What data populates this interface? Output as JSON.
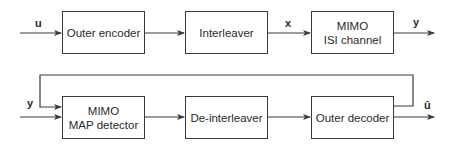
{
  "diagram": {
    "type": "block-diagram",
    "top_row": {
      "blocks": [
        {
          "id": "outer-encoder",
          "lines": [
            "Outer encoder"
          ]
        },
        {
          "id": "interleaver",
          "lines": [
            "Interleaver"
          ]
        },
        {
          "id": "mimo-isi-channel",
          "lines": [
            "MIMO",
            "ISI channel"
          ]
        }
      ],
      "signals": {
        "input": "u",
        "between_interleaver_channel": "x",
        "output": "y"
      }
    },
    "bottom_row": {
      "blocks": [
        {
          "id": "mimo-map-detector",
          "lines": [
            "MIMO",
            "MAP detector"
          ]
        },
        {
          "id": "de-interleaver",
          "lines": [
            "De-interleaver"
          ]
        },
        {
          "id": "outer-decoder",
          "lines": [
            "Outer decoder"
          ]
        }
      ],
      "signals": {
        "input": "y",
        "output": "û"
      }
    },
    "feedback": {
      "from": "outer-decoder",
      "to": "mimo-map-detector"
    },
    "colors": {
      "line": "#3a3a3a",
      "background": "#ffffff"
    }
  }
}
